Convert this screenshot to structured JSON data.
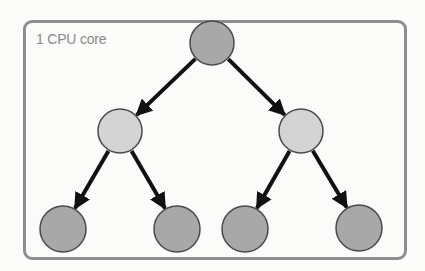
{
  "label": "1 CPU core",
  "colors": {
    "frame": "#8e8e8e",
    "dark_node": "#a8a8a8",
    "light_node": "#d4d4d4",
    "node_stroke": "#4a4a4a",
    "arrow": "#111111"
  },
  "tree": {
    "nodes": [
      {
        "id": "root",
        "cx": 212,
        "cy": 43,
        "r": 22,
        "shade": "dark"
      },
      {
        "id": "mid-left",
        "cx": 120,
        "cy": 131,
        "r": 22,
        "shade": "light"
      },
      {
        "id": "mid-right",
        "cx": 301,
        "cy": 131,
        "r": 22,
        "shade": "light"
      },
      {
        "id": "leaf-1",
        "cx": 63,
        "cy": 229,
        "r": 23,
        "shade": "dark"
      },
      {
        "id": "leaf-2",
        "cx": 177,
        "cy": 229,
        "r": 23,
        "shade": "dark"
      },
      {
        "id": "leaf-3",
        "cx": 245,
        "cy": 229,
        "r": 23,
        "shade": "dark"
      },
      {
        "id": "leaf-4",
        "cx": 359,
        "cy": 228,
        "r": 23,
        "shade": "dark"
      }
    ],
    "edges": [
      [
        "root",
        "mid-left"
      ],
      [
        "root",
        "mid-right"
      ],
      [
        "mid-left",
        "leaf-1"
      ],
      [
        "mid-left",
        "leaf-2"
      ],
      [
        "mid-right",
        "leaf-3"
      ],
      [
        "mid-right",
        "leaf-4"
      ]
    ]
  }
}
